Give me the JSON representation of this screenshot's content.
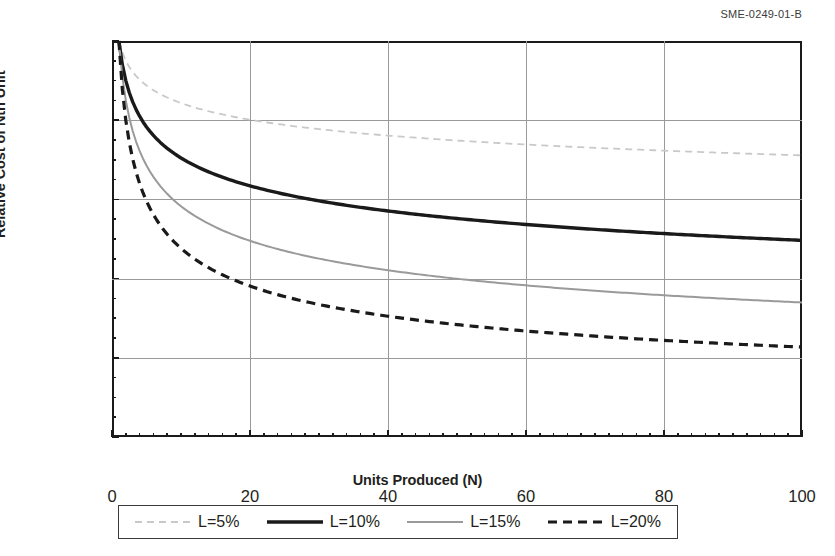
{
  "figure": {
    "reference_code": "SME-0249-01-B"
  },
  "chart_data": {
    "type": "line",
    "title": "",
    "xlabel": "Units Produced (N)",
    "ylabel": "Relative Cost of Nth Unit",
    "xlim": [
      0,
      100
    ],
    "ylim": [
      0.0,
      1.0
    ],
    "grid": true,
    "x_ticks": [
      0,
      20,
      40,
      60,
      80,
      100
    ],
    "x_tick_labels": [
      "0",
      "20",
      "40",
      "60",
      "80",
      "100"
    ],
    "x_minor_tick_step": 2,
    "y_ticks": [
      0.0,
      0.2,
      0.4,
      0.6,
      0.8,
      1.0
    ],
    "y_tick_labels": [
      "0.00",
      "0.20",
      "0.40",
      "0.60",
      "0.80",
      "1.00"
    ],
    "y_minor_tick_step": 0.05,
    "legend_position": "below-plot",
    "x": [
      1,
      2,
      3,
      4,
      5,
      6,
      7,
      8,
      9,
      10,
      12,
      14,
      16,
      18,
      20,
      25,
      30,
      35,
      40,
      45,
      50,
      55,
      60,
      65,
      70,
      75,
      80,
      85,
      90,
      95,
      100
    ],
    "series": [
      {
        "name": "L=5%",
        "label": "L=5%",
        "learning_rate_percent": 5,
        "slope": 0.95,
        "color": "#c9c9c9",
        "style": "dashed",
        "width": 1.8,
        "values": [
          1.0,
          0.95,
          0.922,
          0.903,
          0.888,
          0.876,
          0.866,
          0.857,
          0.85,
          0.843,
          0.831,
          0.822,
          0.814,
          0.807,
          0.801,
          0.789,
          0.779,
          0.771,
          0.764,
          0.758,
          0.753,
          0.748,
          0.744,
          0.74,
          0.737,
          0.733,
          0.73,
          0.727,
          0.725,
          0.722,
          0.72
        ]
      },
      {
        "name": "L=10%",
        "label": "L=10%",
        "learning_rate_percent": 10,
        "slope": 0.9,
        "color": "#1a1a1a",
        "style": "solid",
        "width": 3.4,
        "values": [
          1.0,
          0.9,
          0.846,
          0.81,
          0.783,
          0.762,
          0.744,
          0.729,
          0.716,
          0.705,
          0.686,
          0.67,
          0.656,
          0.645,
          0.634,
          0.612,
          0.596,
          0.581,
          0.57,
          0.56,
          0.552,
          0.544,
          0.537,
          0.531,
          0.525,
          0.52,
          0.515,
          0.511,
          0.507,
          0.503,
          0.5
        ]
      },
      {
        "name": "L=15%",
        "label": "L=15%",
        "learning_rate_percent": 15,
        "slope": 0.85,
        "color": "#9a9a9a",
        "style": "solid",
        "width": 2.0,
        "values": [
          1.0,
          0.85,
          0.773,
          0.723,
          0.686,
          0.657,
          0.634,
          0.614,
          0.597,
          0.583,
          0.559,
          0.539,
          0.522,
          0.508,
          0.495,
          0.469,
          0.449,
          0.432,
          0.418,
          0.407,
          0.397,
          0.388,
          0.381,
          0.374,
          0.367,
          0.362,
          0.356,
          0.352,
          0.347,
          0.343,
          0.34
        ]
      },
      {
        "name": "L=20%",
        "label": "L=20%",
        "learning_rate_percent": 20,
        "slope": 0.8,
        "color": "#1a1a1a",
        "style": "dashed-heavy",
        "width": 3.2,
        "values": [
          1.0,
          0.8,
          0.702,
          0.64,
          0.596,
          0.562,
          0.534,
          0.512,
          0.493,
          0.477,
          0.45,
          0.427,
          0.41,
          0.394,
          0.381,
          0.354,
          0.333,
          0.315,
          0.301,
          0.289,
          0.279,
          0.27,
          0.262,
          0.254,
          0.248,
          0.242,
          0.236,
          0.232,
          0.227,
          0.223,
          0.219
        ]
      }
    ]
  }
}
